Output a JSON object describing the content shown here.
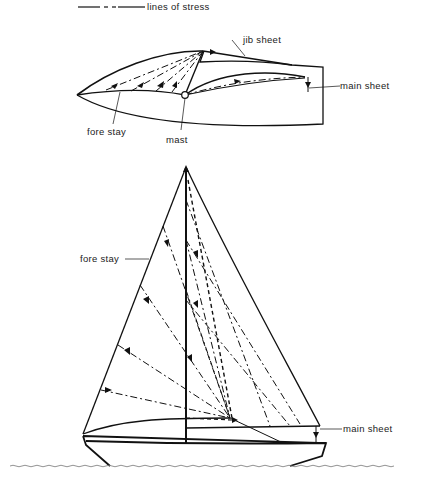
{
  "legend": {
    "label": "lines of stress"
  },
  "plan_view": {
    "labels": {
      "jib_sheet": "jib sheet",
      "main_sheet": "main sheet",
      "fore_stay": "fore stay",
      "mast": "mast"
    }
  },
  "side_view": {
    "labels": {
      "fore_stay": "fore stay",
      "main_sheet": "main sheet"
    }
  },
  "colors": {
    "line": "#111111",
    "text": "#222222",
    "background": "#ffffff",
    "water": "#777777"
  }
}
